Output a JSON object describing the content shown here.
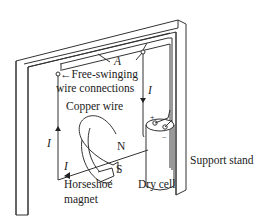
{
  "diagram": {
    "labels": {
      "segment_a": "A",
      "free_swinging_line1": "Free-swinging",
      "free_swinging_line2": "wire connections",
      "copper_wire": "Copper wire",
      "current_right": "I",
      "current_left": "I",
      "current_bottom": "I",
      "north_pole": "N",
      "south_pole": "S",
      "magnet_line1": "Horseshoe",
      "magnet_line2": "magnet",
      "dry_cell": "Dry cell",
      "support_stand": "Support stand",
      "plus": "+",
      "minus": "−"
    },
    "colors": {
      "line": "#333333",
      "text": "#222222",
      "background": "#ffffff"
    }
  }
}
